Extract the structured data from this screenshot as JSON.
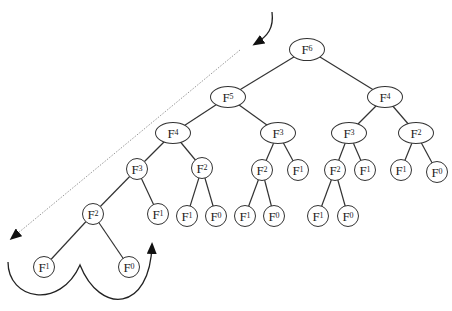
{
  "diagram": {
    "type": "fibonacci-recursion-tree",
    "root": "F6",
    "nodes": [
      {
        "id": "n0",
        "base": "F",
        "sub": "6",
        "x": 307,
        "y": 49,
        "w": 36,
        "h": 23,
        "parent": null
      },
      {
        "id": "n1",
        "base": "F",
        "sub": "5",
        "x": 228,
        "y": 97,
        "w": 36,
        "h": 22,
        "parent": "n0"
      },
      {
        "id": "n2",
        "base": "F",
        "sub": "4",
        "x": 385,
        "y": 97,
        "w": 36,
        "h": 22,
        "parent": "n0"
      },
      {
        "id": "n3",
        "base": "F",
        "sub": "4",
        "x": 173,
        "y": 133,
        "w": 36,
        "h": 22,
        "parent": "n1"
      },
      {
        "id": "n4",
        "base": "F",
        "sub": "3",
        "x": 278,
        "y": 133,
        "w": 36,
        "h": 22,
        "parent": "n1"
      },
      {
        "id": "n5",
        "base": "F",
        "sub": "3",
        "x": 349,
        "y": 133,
        "w": 36,
        "h": 22,
        "parent": "n2"
      },
      {
        "id": "n6",
        "base": "F",
        "sub": "2",
        "x": 416,
        "y": 133,
        "w": 36,
        "h": 22,
        "parent": "n2"
      },
      {
        "id": "n7",
        "base": "F",
        "sub": "3",
        "x": 137,
        "y": 169,
        "w": 22,
        "h": 22,
        "parent": "n3"
      },
      {
        "id": "n8",
        "base": "F",
        "sub": "2",
        "x": 202,
        "y": 168,
        "w": 22,
        "h": 22,
        "parent": "n3"
      },
      {
        "id": "n9",
        "base": "F",
        "sub": "2",
        "x": 262,
        "y": 170,
        "w": 22,
        "h": 22,
        "parent": "n4"
      },
      {
        "id": "n10",
        "base": "F",
        "sub": "1",
        "x": 298,
        "y": 170,
        "w": 22,
        "h": 22,
        "parent": "n4"
      },
      {
        "id": "n11",
        "base": "F",
        "sub": "2",
        "x": 335,
        "y": 170,
        "w": 22,
        "h": 22,
        "parent": "n5"
      },
      {
        "id": "n12",
        "base": "F",
        "sub": "1",
        "x": 365,
        "y": 170,
        "w": 22,
        "h": 22,
        "parent": "n5"
      },
      {
        "id": "n13",
        "base": "F",
        "sub": "1",
        "x": 401,
        "y": 170,
        "w": 22,
        "h": 22,
        "parent": "n6"
      },
      {
        "id": "n14",
        "base": "F",
        "sub": "0",
        "x": 437,
        "y": 172,
        "w": 22,
        "h": 22,
        "parent": "n6"
      },
      {
        "id": "n15",
        "base": "F",
        "sub": "2",
        "x": 93,
        "y": 214,
        "w": 22,
        "h": 22,
        "parent": "n7"
      },
      {
        "id": "n16",
        "base": "F",
        "sub": "1",
        "x": 158,
        "y": 214,
        "w": 22,
        "h": 22,
        "parent": "n7"
      },
      {
        "id": "n17",
        "base": "F",
        "sub": "1",
        "x": 187,
        "y": 216,
        "w": 22,
        "h": 22,
        "parent": "n8"
      },
      {
        "id": "n18",
        "base": "F",
        "sub": "0",
        "x": 216,
        "y": 216,
        "w": 22,
        "h": 22,
        "parent": "n8"
      },
      {
        "id": "n19",
        "base": "F",
        "sub": "1",
        "x": 245,
        "y": 216,
        "w": 22,
        "h": 22,
        "parent": "n9"
      },
      {
        "id": "n20",
        "base": "F",
        "sub": "0",
        "x": 274,
        "y": 216,
        "w": 22,
        "h": 22,
        "parent": "n9"
      },
      {
        "id": "n21",
        "base": "F",
        "sub": "1",
        "x": 318,
        "y": 216,
        "w": 22,
        "h": 22,
        "parent": "n11"
      },
      {
        "id": "n22",
        "base": "F",
        "sub": "0",
        "x": 348,
        "y": 216,
        "w": 22,
        "h": 22,
        "parent": "n11"
      },
      {
        "id": "n23",
        "base": "F",
        "sub": "1",
        "x": 44,
        "y": 267,
        "w": 22,
        "h": 22,
        "parent": "n15"
      },
      {
        "id": "n24",
        "base": "F",
        "sub": "0",
        "x": 129,
        "y": 267,
        "w": 22,
        "h": 22,
        "parent": "n15"
      }
    ],
    "annotations": {
      "descent_arrow": {
        "style": "dotted",
        "from": [
          240,
          50
        ],
        "to": [
          12,
          238
        ],
        "color": "#888888"
      },
      "entry_arrow": {
        "style": "solid-curved",
        "from": [
          272,
          12
        ],
        "to": [
          255,
          44
        ],
        "color": "#222222"
      },
      "return_arrow": {
        "style": "solid-curved-w",
        "path": "M 8 262 C 8 300, 60 310, 80 265 C 100 315, 150 312, 152 245",
        "color": "#222222"
      }
    },
    "colors": {
      "edge": "#333333",
      "node_border": "#333333",
      "text": "#222222",
      "background": "#ffffff"
    }
  }
}
